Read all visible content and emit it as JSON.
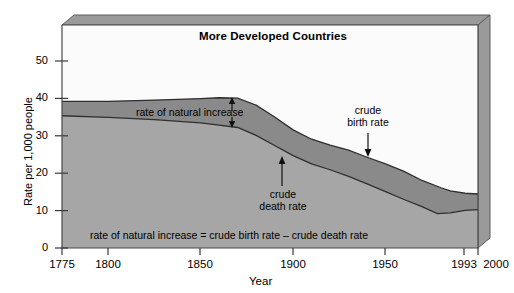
{
  "chart_data": {
    "type": "area",
    "title": "More Developed Countries",
    "xlabel": "Year",
    "ylabel": "Rate per 1,000 people",
    "xlim": [
      1775,
      2000
    ],
    "ylim": [
      0,
      57
    ],
    "ytick_values": [
      0,
      10,
      20,
      30,
      40,
      50
    ],
    "ytick_labels": [
      "0",
      "10",
      "20",
      "30",
      "40",
      "50"
    ],
    "xtick_values": [
      1775,
      1800,
      1850,
      1900,
      1950,
      1993,
      2000
    ],
    "xtick_labels": [
      "1775",
      "1800",
      "1850",
      "1900",
      "1950",
      "1993",
      "2000"
    ],
    "grid": false,
    "legend": "none",
    "series": [
      {
        "name": "crude birth rate",
        "points": [
          [
            1775,
            37.5
          ],
          [
            1800,
            37.5
          ],
          [
            1825,
            37.8
          ],
          [
            1850,
            38.2
          ],
          [
            1860,
            38.4
          ],
          [
            1870,
            38.3
          ],
          [
            1880,
            36.5
          ],
          [
            1890,
            33.5
          ],
          [
            1900,
            30.2
          ],
          [
            1910,
            27.8
          ],
          [
            1920,
            26.3
          ],
          [
            1930,
            25.0
          ],
          [
            1940,
            23.2
          ],
          [
            1950,
            21.5
          ],
          [
            1960,
            19.6
          ],
          [
            1970,
            17.2
          ],
          [
            1980,
            15.4
          ],
          [
            1985,
            14.6
          ],
          [
            1993,
            14.0
          ],
          [
            2000,
            13.8
          ]
        ]
      },
      {
        "name": "crude death rate",
        "points": [
          [
            1775,
            33.8
          ],
          [
            1800,
            33.4
          ],
          [
            1825,
            32.8
          ],
          [
            1850,
            32.0
          ],
          [
            1860,
            31.4
          ],
          [
            1870,
            30.8
          ],
          [
            1880,
            28.8
          ],
          [
            1890,
            26.2
          ],
          [
            1900,
            23.6
          ],
          [
            1910,
            21.5
          ],
          [
            1920,
            20.0
          ],
          [
            1930,
            18.3
          ],
          [
            1940,
            16.4
          ],
          [
            1950,
            14.4
          ],
          [
            1960,
            12.4
          ],
          [
            1970,
            10.5
          ],
          [
            1978,
            8.8
          ],
          [
            1985,
            9.0
          ],
          [
            1993,
            9.6
          ],
          [
            2000,
            9.8
          ]
        ]
      }
    ],
    "annotations": [
      {
        "id": "rate-of-natural-increase",
        "text": "rate of natural increase",
        "marker": "double-headed-vertical-arrow"
      },
      {
        "id": "crude-death-rate",
        "text": "crude death rate",
        "marker": "up-arrow"
      },
      {
        "id": "crude-birth-rate",
        "text": "crude birth rate",
        "marker": "down-arrow"
      }
    ],
    "equation": "rate of natural increase = crude birth rate – crude death rate",
    "colors": {
      "band_natural_increase": "#8c8c8c",
      "band_death_rate": "#a8a8a8",
      "plot_background": "#f4f4f4",
      "frame_bevel": "#999999",
      "frame_bevel_dark": "#7a7a7a",
      "line": "#3a3a3a",
      "text": "#000000"
    }
  },
  "annotations_text": {
    "natural_increase": "rate of natural increase",
    "crude_death_line1": "crude",
    "crude_death_line2": "death rate",
    "crude_birth_line1": "crude",
    "crude_birth_line2": "birth rate"
  },
  "axes": {
    "y_label": "Rate per 1,000 people",
    "x_label": "Year",
    "y_ticks": [
      "50",
      "40",
      "30",
      "20",
      "10",
      "0"
    ],
    "x_ticks": [
      "1775",
      "1800",
      "1850",
      "1900",
      "1950",
      "1993",
      "2000"
    ]
  },
  "title": "More Developed Countries",
  "equation_text": "rate of natural increase = crude birth rate – crude death rate"
}
